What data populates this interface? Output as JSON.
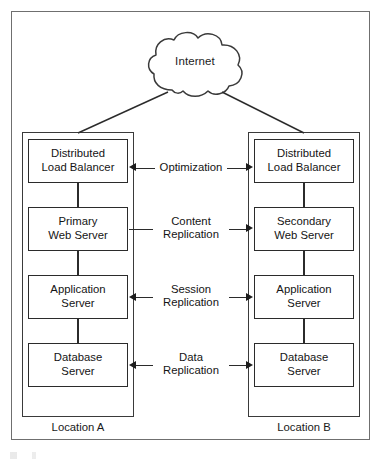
{
  "figure": {
    "kind": "network-architecture-diagram",
    "cloud": {
      "label": "Internet",
      "icon": "cloud-icon"
    },
    "groups": [
      {
        "id": "location-a",
        "caption": "Location A",
        "nodes": [
          {
            "id": "lb-a",
            "lines": [
              "Distributed",
              "Load Balancer"
            ]
          },
          {
            "id": "web-a",
            "lines": [
              "Primary",
              "Web Server"
            ]
          },
          {
            "id": "app-a",
            "lines": [
              "Application",
              "Server"
            ]
          },
          {
            "id": "db-a",
            "lines": [
              "Database",
              "Server"
            ]
          }
        ]
      },
      {
        "id": "location-b",
        "caption": "Location B",
        "nodes": [
          {
            "id": "lb-b",
            "lines": [
              "Distributed",
              "Load Balancer"
            ]
          },
          {
            "id": "web-b",
            "lines": [
              "Secondary",
              "Web Server"
            ]
          },
          {
            "id": "app-b",
            "lines": [
              "Application",
              "Server"
            ]
          },
          {
            "id": "db-b",
            "lines": [
              "Database",
              "Server"
            ]
          }
        ]
      }
    ],
    "links": [
      {
        "id": "link-optimization",
        "lines": [
          "Optimization"
        ],
        "arrow_left": true,
        "arrow_right": true
      },
      {
        "id": "link-content-replication",
        "lines": [
          "Content",
          "Replication"
        ],
        "arrow_left": false,
        "arrow_right": true
      },
      {
        "id": "link-session-replication",
        "lines": [
          "Session",
          "Replication"
        ],
        "arrow_left": true,
        "arrow_right": true
      },
      {
        "id": "link-data-replication",
        "lines": [
          "Data",
          "Replication"
        ],
        "arrow_left": true,
        "arrow_right": true
      }
    ],
    "colors": {
      "frame": "#6f6f6f",
      "box_stroke": "#2b2b2b",
      "group_stroke": "#3a3a3a",
      "text": "#141414",
      "background": "#ffffff"
    }
  }
}
